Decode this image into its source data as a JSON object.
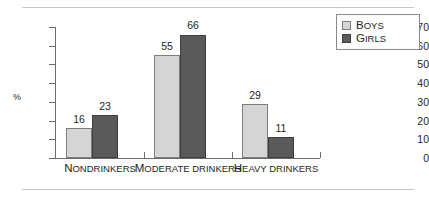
{
  "chart_data": {
    "type": "bar",
    "title": "",
    "xlabel": "",
    "ylabel": "%",
    "ylim": [
      0,
      70
    ],
    "ytick_step": 10,
    "yticks": [
      70,
      60,
      50,
      40,
      30,
      20,
      10,
      0
    ],
    "grid": false,
    "legend_position": "top-right",
    "categories": [
      "Nondrinkers",
      "Moderate drinkers",
      "Heavy drinkers"
    ],
    "series": [
      {
        "name": "Boys",
        "color": "#d5d5d5",
        "values": [
          16,
          55,
          29
        ]
      },
      {
        "name": "Girls",
        "color": "#5a5a5a",
        "values": [
          23,
          66,
          11
        ]
      }
    ]
  },
  "legend": {
    "items": [
      {
        "label_first": "B",
        "label_rest": "OYS"
      },
      {
        "label_first": "G",
        "label_rest": "IRLS"
      }
    ]
  },
  "axis": {
    "y_label": "%",
    "y_tick_labels": [
      "70",
      "60",
      "50",
      "40",
      "30",
      "20",
      "10",
      "0"
    ]
  },
  "categories_display": [
    {
      "first": "N",
      "rest": "ONDRINKERS"
    },
    {
      "first": "M",
      "rest": "ODERATE DRINKERS"
    },
    {
      "first": "H",
      "rest": "EAVY DRINKERS"
    }
  ],
  "bar_labels": {
    "g0s0": "16",
    "g0s1": "23",
    "g1s0": "55",
    "g1s1": "66",
    "g2s0": "29",
    "g2s1": "11"
  }
}
